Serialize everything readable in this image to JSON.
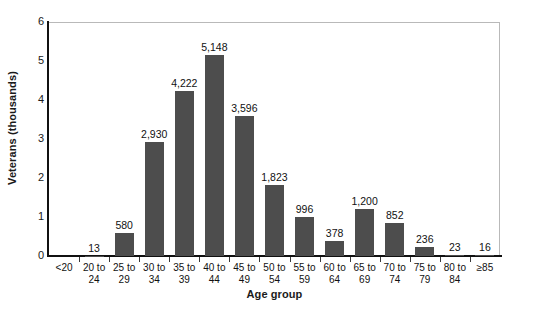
{
  "chart_data": {
    "type": "bar",
    "title": "",
    "xlabel": "Age group",
    "ylabel": "Veterans (thousands)",
    "categories": [
      "<20",
      "20 to 24",
      "25 to 29",
      "30 to 34",
      "35 to 39",
      "40 to 44",
      "45 to 49",
      "50 to 54",
      "55 to 59",
      "60 to 64",
      "65 to 69",
      "70 to 74",
      "75 to 79",
      "80 to 84",
      "≥85"
    ],
    "category_lines": [
      [
        "<20",
        ""
      ],
      [
        "20 to",
        "24"
      ],
      [
        "25 to",
        "29"
      ],
      [
        "30 to",
        "34"
      ],
      [
        "35 to",
        "39"
      ],
      [
        "40 to",
        "44"
      ],
      [
        "45 to",
        "49"
      ],
      [
        "50 to",
        "54"
      ],
      [
        "55 to",
        "59"
      ],
      [
        "60 to",
        "64"
      ],
      [
        "65 to",
        "69"
      ],
      [
        "70 to",
        "74"
      ],
      [
        "75 to",
        "79"
      ],
      [
        "80 to",
        "84"
      ],
      [
        "≥85",
        ""
      ]
    ],
    "values": [
      0,
      13,
      580,
      2930,
      4222,
      5148,
      3596,
      1823,
      996,
      378,
      1200,
      852,
      236,
      23,
      16
    ],
    "value_labels": [
      "",
      "13",
      "580",
      "2,930",
      "4,222",
      "5,148",
      "3,596",
      "1,823",
      "996",
      "378",
      "1,200",
      "852",
      "236",
      "23",
      "16"
    ],
    "yticks": [
      0,
      1,
      2,
      3,
      4,
      5,
      6
    ],
    "ytick_labels": [
      "0",
      "1",
      "2",
      "3",
      "4",
      "5",
      "6"
    ],
    "ylim": [
      0,
      6000
    ],
    "value_unit": "thousands",
    "grid": false,
    "legend": null,
    "bar_color": "#4d4d4d",
    "axis_color": "#111111",
    "frame_color": "#b9b9b9"
  }
}
